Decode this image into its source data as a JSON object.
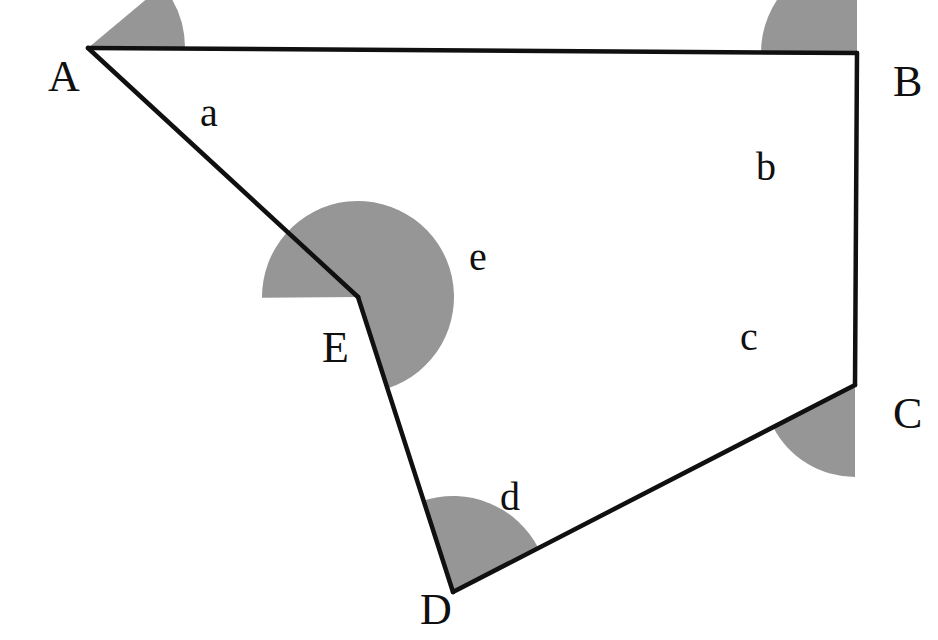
{
  "figure": {
    "background_color": "#ffffff",
    "stroke_color": "#101010",
    "stroke_width": 4.5,
    "sector_fill_color": "#969696",
    "label_color": "#101010",
    "width": 938,
    "height": 640
  },
  "vertices": [
    {
      "name": "A",
      "label": "A",
      "x": 88,
      "y": 48,
      "label_x": 48,
      "label_y": 55
    },
    {
      "name": "B",
      "label": "B",
      "x": 857,
      "y": 53,
      "label_x": 893,
      "label_y": 60
    },
    {
      "name": "C",
      "label": "C",
      "x": 855,
      "y": 385,
      "label_x": 893,
      "label_y": 392
    },
    {
      "name": "D",
      "label": "D",
      "x": 453,
      "y": 592,
      "label_x": 420,
      "label_y": 588
    },
    {
      "name": "E",
      "label": "E",
      "x": 358,
      "y": 297,
      "label_x": 322,
      "label_y": 326
    }
  ],
  "edges": [
    {
      "name": "edge-AB",
      "from": "A",
      "to": "B"
    },
    {
      "name": "edge-BC",
      "from": "B",
      "to": "C"
    },
    {
      "name": "edge-CD",
      "from": "C",
      "to": "D"
    },
    {
      "name": "edge-DE",
      "from": "D",
      "to": "E"
    },
    {
      "name": "edge-EA",
      "from": "E",
      "to": "A"
    }
  ],
  "angles": [
    {
      "name": "angle-a",
      "label": "a",
      "at_vertex": "A",
      "reflex": false,
      "radius": 97,
      "start_deg": 0.4,
      "end_deg": 39.9,
      "sweep_deg": 39.5,
      "label_x": 200,
      "label_y": 93
    },
    {
      "name": "angle-b",
      "label": "b",
      "at_vertex": "B",
      "reflex": false,
      "radius": 96,
      "start_deg": 90.0,
      "end_deg": 180.4,
      "sweep_deg": 90.4,
      "label_x": 756,
      "label_y": 147
    },
    {
      "name": "angle-c",
      "label": "c",
      "at_vertex": "C",
      "reflex": false,
      "radius": 92,
      "start_deg": 207.3,
      "end_deg": 270.0,
      "sweep_deg": 62.7,
      "label_x": 740,
      "label_y": 317
    },
    {
      "name": "angle-d",
      "label": "d",
      "at_vertex": "D",
      "reflex": false,
      "radius": 96,
      "start_deg": 27.3,
      "end_deg": 108.2,
      "sweep_deg": 80.9,
      "label_x": 500,
      "label_y": 477
    },
    {
      "name": "angle-e",
      "label": "e",
      "at_vertex": "E",
      "reflex": true,
      "radius": 96,
      "start_deg": 288.2,
      "end_deg": 180.4,
      "sweep_deg": 252.2,
      "label_x": 469,
      "label_y": 237
    }
  ]
}
